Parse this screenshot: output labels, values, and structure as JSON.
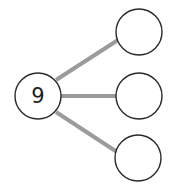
{
  "diagram": {
    "type": "number-bond",
    "colors": {
      "background": "#ffffff",
      "circle_stroke": "#2a2a2a",
      "circle_fill": "#ffffff",
      "connector": "#9b9b9b",
      "label": "#1e1e1e"
    },
    "root": {
      "label": "9",
      "cx": 38,
      "cy": 96,
      "r": 23
    },
    "children": [
      {
        "label": "",
        "cx": 139,
        "cy": 32,
        "r": 23
      },
      {
        "label": "",
        "cx": 139,
        "cy": 96,
        "r": 23
      },
      {
        "label": "",
        "cx": 138,
        "cy": 158,
        "r": 23
      }
    ]
  }
}
